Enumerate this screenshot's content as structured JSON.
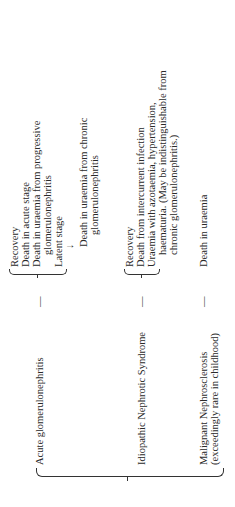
{
  "conditions": [
    {
      "name": "Acute glomerulonephritis",
      "dash": "—",
      "outcomes": [
        "Recovery",
        "Death in acute stage",
        "Death in uraemia from progressive",
        "glomerulonephritis",
        "Latent stage"
      ],
      "arrow": "↓",
      "after_arrow": [
        "Death in uraemia from chronic",
        "glomerulonephritis"
      ]
    },
    {
      "name": "Idiopathic Nephrotic Syndrome",
      "dash": "—",
      "outcomes": [
        "Recovery",
        "Death from intercurrent infection",
        "Uraemia with azotaemia, hypertension,",
        "haematuria. (May be indistinguishable from",
        "chronic glomerulonephritis.)"
      ]
    },
    {
      "name": "Malignant Nephrosclerosis",
      "note": "(exceedingly rare in childhood)",
      "dash": "—",
      "outcomes": [
        "Death in uraemia"
      ]
    }
  ]
}
